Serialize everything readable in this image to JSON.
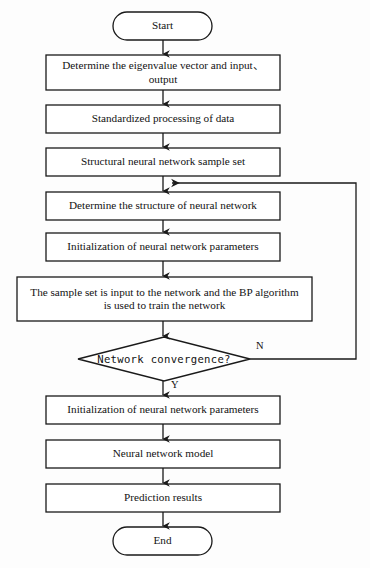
{
  "diagram": {
    "background_color": "#fdfdfd",
    "stroke_color": "#1a1a1a",
    "text_color": "#121212"
  },
  "nodes": {
    "start": {
      "label": "Start",
      "shape": "terminator"
    },
    "step1": {
      "label": "Determine the eigenvalue vector and input、output",
      "shape": "process"
    },
    "step2": {
      "label": "Standardized processing of data",
      "shape": "process"
    },
    "step3": {
      "label": "Structural neural network sample set",
      "shape": "process"
    },
    "step4": {
      "label": "Determine the structure of neural network",
      "shape": "process"
    },
    "step5": {
      "label": "Initialization of neural network parameters",
      "shape": "process"
    },
    "step6": {
      "label": "The sample set is input to the network and the BP algorithm is used to train the network",
      "shape": "process"
    },
    "decision": {
      "label": "Network convergence?",
      "shape": "decision"
    },
    "step7": {
      "label": "Initialization of neural network parameters",
      "shape": "process"
    },
    "step8": {
      "label": "Neural network model",
      "shape": "process"
    },
    "step9": {
      "label": "Prediction results",
      "shape": "process"
    },
    "end": {
      "label": "End",
      "shape": "terminator"
    }
  },
  "edge_labels": {
    "no_branch": "N",
    "yes_branch": "Y"
  },
  "icons": {
    "arrow": "arrowhead-icon"
  }
}
